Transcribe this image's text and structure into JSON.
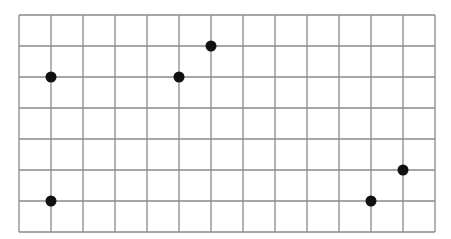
{
  "diagram": {
    "type": "dot-grid",
    "columns": 13,
    "rows": 7,
    "colors": {
      "background": "#ffffff",
      "grid_line": "#8a8a8a",
      "dot": "#111111"
    },
    "dots": [
      {
        "col": 1,
        "row": 2
      },
      {
        "col": 5,
        "row": 2
      },
      {
        "col": 6,
        "row": 1
      },
      {
        "col": 1,
        "row": 6
      },
      {
        "col": 11,
        "row": 6
      },
      {
        "col": 12,
        "row": 5
      }
    ]
  }
}
